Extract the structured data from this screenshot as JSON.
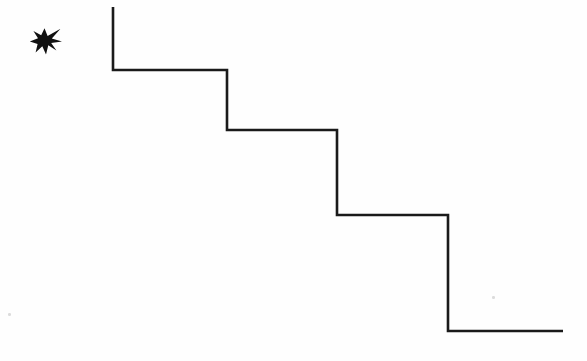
{
  "figure": {
    "background_color": "#fefefe",
    "width": 587,
    "height": 361,
    "stroke_color": "#1a1a1a",
    "stroke_width": 2.6,
    "star": {
      "name": "star-burst",
      "fill_color": "#111111",
      "center_x": 45,
      "center_y": 41,
      "points": 7,
      "bbox": [
        30,
        28,
        32,
        27
      ],
      "path": "M 44.5 28.2 L 47.6 36.0 L 60.5 28.8 L 51.8 38.6 L 62.0 41.4 L 51.2 43.1 L 56.4 50.4 L 48.3 45.3 L 46.0 54.6 L 42.3 46.2 L 35.6 52.6 L 37.6 44.1 L 29.8 41.6 L 38.0 38.3 L 33.4 31.0 L 41.2 35.3 Z"
    },
    "staircase": {
      "name": "staircase-polyline",
      "path": "M 113 7 L 113 70 L 227 70 L 227 130 L 337 130 L 337 215 L 448 215 L 448 331 L 563 331",
      "steps": 4,
      "vertices": [
        [
          113,
          7
        ],
        [
          113,
          70
        ],
        [
          227,
          70
        ],
        [
          227,
          130
        ],
        [
          337,
          130
        ],
        [
          337,
          215
        ],
        [
          448,
          215
        ],
        [
          448,
          331
        ],
        [
          563,
          331
        ]
      ]
    },
    "specks": [
      {
        "name": "scan-speck-left",
        "x": 8,
        "y": 313,
        "size": 2.5,
        "color": "#dcdcdc"
      },
      {
        "name": "scan-speck-right",
        "x": 492,
        "y": 296,
        "size": 2.5,
        "color": "#dcdcdc"
      }
    ]
  }
}
